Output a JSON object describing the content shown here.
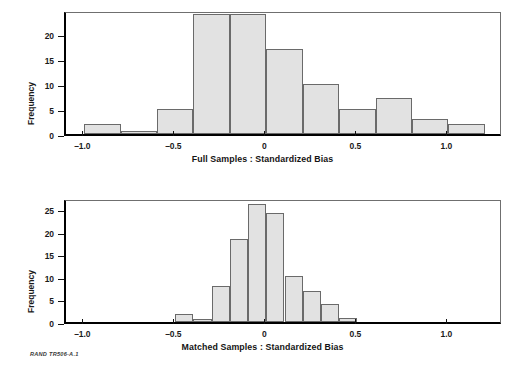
{
  "figure": {
    "credit": "RAND TR506-A.1"
  },
  "panels": [
    {
      "id": "full-samples",
      "xlabel": "Full Samples : Standardized Bias",
      "ylabel": "Frequency"
    },
    {
      "id": "matched-samples",
      "xlabel": "Matched Samples : Standardized Bias",
      "ylabel": "Frequency"
    }
  ],
  "chart_data": [
    {
      "type": "bar",
      "title": "",
      "xlabel": "Full Samples : Standardized Bias",
      "ylabel": "Frequency",
      "xlim": [
        -1.1,
        1.3
      ],
      "ylim": [
        0,
        24.8
      ],
      "grid": false,
      "legend": null,
      "bin_width": 0.2,
      "bin_edges": [
        -1.0,
        -0.8,
        -0.6,
        -0.4,
        -0.2,
        0.0,
        0.2,
        0.4,
        0.6,
        0.8,
        1.0,
        1.2
      ],
      "categories": [
        "-1.0 to -0.8",
        "-0.8 to -0.6",
        "-0.6 to -0.4",
        "-0.4 to -0.2",
        "-0.2 to 0.0",
        "0.0 to 0.2",
        "0.2 to 0.4",
        "0.4 to 0.6",
        "0.6 to 0.8",
        "0.8 to 1.0",
        "1.0 to 1.2"
      ],
      "values": [
        2,
        0.7,
        5,
        24,
        24,
        17,
        10,
        5,
        7.2,
        3,
        2
      ],
      "xticks": [
        -1.0,
        -0.5,
        0.0,
        0.5,
        1.0
      ],
      "xticklabels": [
        "–1.0",
        "–0.5",
        "0",
        "0.5",
        "1.0"
      ],
      "yticks": [
        0,
        5,
        10,
        15,
        20
      ],
      "yticklabels": [
        "0",
        "5",
        "10",
        "15",
        "20"
      ]
    },
    {
      "type": "bar",
      "title": "",
      "xlabel": "Matched Samples : Standardized Bias",
      "ylabel": "Frequency",
      "xlim": [
        -1.1,
        1.3
      ],
      "ylim": [
        0,
        27.5
      ],
      "grid": false,
      "legend": null,
      "bin_width": 0.1,
      "bin_edges": [
        -0.5,
        -0.4,
        -0.3,
        -0.2,
        -0.1,
        0.0,
        0.1,
        0.2,
        0.3,
        0.4,
        0.5
      ],
      "categories": [
        "-0.5 to -0.4",
        "-0.4 to -0.3",
        "-0.3 to -0.2",
        "-0.2 to -0.1",
        "-0.1 to 0.0",
        "0.0 to 0.1",
        "0.1 to 0.2",
        "0.2 to 0.3",
        "0.3 to 0.4",
        "0.4 to 0.5"
      ],
      "values": [
        1.8,
        0.7,
        7.9,
        18.3,
        26.1,
        24.1,
        10.1,
        6.9,
        4.1,
        0.8
      ],
      "xticks": [
        -1.0,
        -0.5,
        0.0,
        0.5,
        1.0
      ],
      "xticklabels": [
        "–1.0",
        "–0.5",
        "0",
        "0.5",
        "1.0"
      ],
      "yticks": [
        0,
        5,
        10,
        15,
        20,
        25
      ],
      "yticklabels": [
        "0",
        "5",
        "10",
        "15",
        "20",
        "25"
      ]
    }
  ]
}
